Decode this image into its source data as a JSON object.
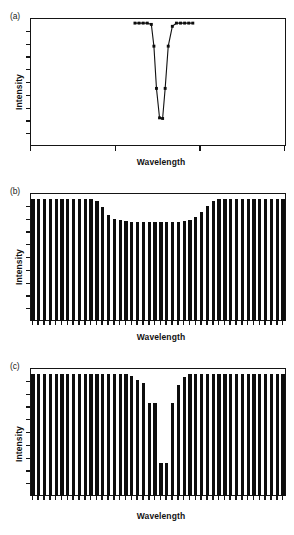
{
  "figure": {
    "ylabel": "Intensity",
    "xlabel": "Wavelength",
    "panels": [
      {
        "id": "a",
        "label": "(a)"
      },
      {
        "id": "b",
        "label": "(b)"
      },
      {
        "id": "c",
        "label": "(c)"
      }
    ]
  },
  "chart_data": [
    {
      "type": "line",
      "panel": "(a)",
      "title": "",
      "xlabel": "Wavelength",
      "ylabel": "Intensity",
      "xlim": [
        0,
        100
      ],
      "ylim": [
        0,
        100
      ],
      "grid": false,
      "legend": null,
      "marker": "filled-square",
      "axis_style": "open-left-bottom-with-box",
      "y_tick_count": 9,
      "x_tick_count": 4,
      "x_tick_positions": [
        0,
        33.3,
        66.7,
        100
      ],
      "x": [
        41.0,
        42.6,
        44.2,
        45.8,
        47.4,
        48.4,
        49.4,
        50.6,
        51.8,
        52.8,
        54.0,
        55.6,
        57.2,
        58.8,
        60.4,
        62.0,
        63.6
      ],
      "y": [
        96.0,
        96.0,
        96.0,
        96.0,
        95.0,
        78.0,
        45.0,
        22.0,
        21.5,
        45.0,
        78.0,
        93.5,
        96.0,
        96.0,
        96.0,
        96.0,
        96.0
      ],
      "annotations": []
    },
    {
      "type": "bar",
      "panel": "(b)",
      "title": "",
      "xlabel": "Wavelength",
      "ylabel": "Intensity",
      "ylim": [
        0,
        100
      ],
      "grid": false,
      "legend": null,
      "axis_style": "box-frame",
      "y_tick_count": 9,
      "x_tick_per_bar": true,
      "bar_count": 44,
      "values": [
        95,
        95,
        95,
        95,
        95,
        95,
        95,
        95,
        95,
        95,
        95,
        94,
        89,
        83,
        80,
        79,
        78,
        77,
        77,
        77,
        77,
        77,
        77,
        77,
        77,
        77,
        78,
        79,
        81,
        85,
        90,
        94,
        95,
        95,
        95,
        95,
        95,
        95,
        95,
        95,
        95,
        95,
        95,
        95
      ],
      "annotations": []
    },
    {
      "type": "bar",
      "panel": "(c)",
      "title": "",
      "xlabel": "Wavelength",
      "ylabel": "Intensity",
      "ylim": [
        0,
        100
      ],
      "grid": false,
      "legend": null,
      "axis_style": "box-frame",
      "y_tick_count": 9,
      "x_tick_per_bar": true,
      "bar_count": 44,
      "values": [
        95,
        95,
        95,
        95,
        95,
        95,
        95,
        95,
        95,
        95,
        95,
        95,
        95,
        95,
        95,
        95,
        95,
        94,
        91,
        88,
        73,
        73,
        26,
        26,
        73,
        87,
        93,
        95,
        95,
        95,
        95,
        95,
        95,
        95,
        95,
        95,
        95,
        95,
        95,
        95,
        95,
        95,
        95,
        95
      ],
      "annotations": []
    }
  ]
}
